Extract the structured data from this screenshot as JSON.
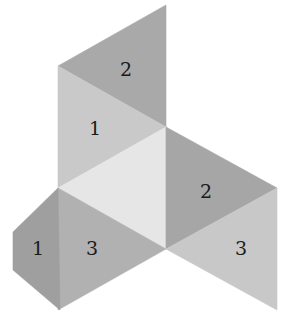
{
  "diagram": {
    "type": "polyhedron-net",
    "background": "#ffffff",
    "faces": [
      {
        "id": "top-2",
        "label": "2",
        "points": "166,5 58,66 166,127",
        "fill": "#a9a9a9",
        "label_x": 126,
        "label_y": 76
      },
      {
        "id": "upper-1",
        "label": "1",
        "points": "58,66 166,127 58,188",
        "fill": "#c9c9c9",
        "label_x": 95,
        "label_y": 135
      },
      {
        "id": "center-blank",
        "label": "",
        "points": "58,188 166,127 166,249",
        "fill": "#e6e6e6",
        "label_x": 0,
        "label_y": 0
      },
      {
        "id": "right-2",
        "label": "2",
        "points": "166,127 277,188 166,249",
        "fill": "#a6a6a6",
        "label_x": 206,
        "label_y": 198
      },
      {
        "id": "right-3",
        "label": "3",
        "points": "166,249 277,188 277,310",
        "fill": "#c8c8c8",
        "label_x": 241,
        "label_y": 255
      },
      {
        "id": "left-3",
        "label": "3",
        "points": "58,188 166,249 58,310",
        "fill": "#b1b1b1",
        "label_x": 92,
        "label_y": 255
      },
      {
        "id": "left-1",
        "label": "1",
        "points": "58,188 13,232 13,270 60,310 58,188",
        "fill": "#9f9f9f",
        "label_x": 38,
        "label_y": 255
      }
    ]
  }
}
